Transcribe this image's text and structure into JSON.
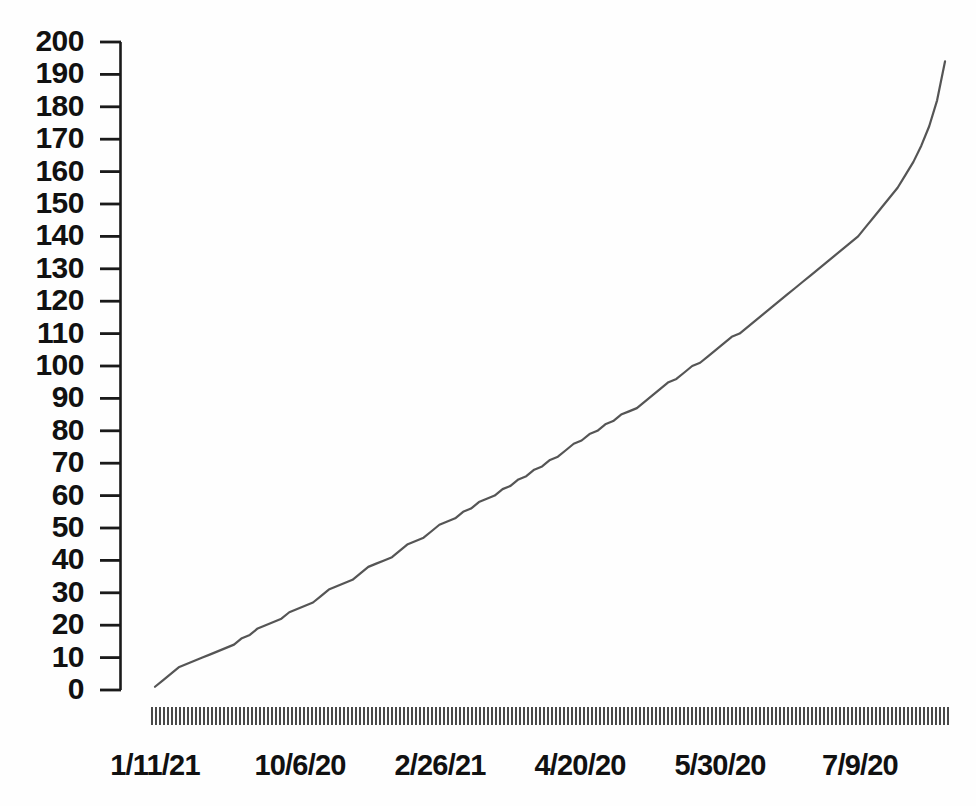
{
  "chart_data": {
    "type": "line",
    "title": "",
    "subtitle": "",
    "xlabel": "",
    "ylabel": "",
    "ylim": [
      0,
      200
    ],
    "grid": false,
    "legend": null,
    "y_ticks": [
      200,
      190,
      180,
      170,
      160,
      150,
      140,
      130,
      120,
      110,
      100,
      90,
      80,
      70,
      60,
      50,
      40,
      30,
      20,
      10,
      0
    ],
    "x_tick_labels": [
      "1/11/21",
      "10/6/20",
      "2/26/21",
      "4/20/20",
      "5/30/20",
      "7/9/20"
    ],
    "x_tick_label_positions_px": [
      155,
      300,
      440,
      580,
      720,
      860
    ],
    "x_minor_tick_count": 200,
    "series": [
      {
        "name": "cumulative",
        "color": "#555555",
        "x": [
          0,
          1,
          2,
          3,
          4,
          5,
          6,
          7,
          8,
          9,
          10,
          11,
          12,
          13,
          14,
          15,
          16,
          17,
          18,
          19,
          20,
          21,
          22,
          23,
          24,
          25,
          26,
          27,
          28,
          29,
          30,
          31,
          32,
          33,
          34,
          35,
          36,
          37,
          38,
          39,
          40,
          41,
          42,
          43,
          44,
          45,
          46,
          47,
          48,
          49,
          50,
          51,
          52,
          53,
          54,
          55,
          56,
          57,
          58,
          59,
          60,
          61,
          62,
          63,
          64,
          65,
          66,
          67,
          68,
          69,
          70,
          71,
          72,
          73,
          74,
          75,
          76,
          77,
          78,
          79,
          80,
          81,
          82,
          83,
          84,
          85,
          86,
          87,
          88,
          89,
          90,
          91,
          92,
          93,
          94,
          95,
          96,
          97,
          98,
          99,
          100
        ],
        "values": [
          1,
          3,
          5,
          7,
          8,
          9,
          10,
          11,
          12,
          13,
          14,
          16,
          17,
          19,
          20,
          21,
          22,
          24,
          25,
          26,
          27,
          29,
          31,
          32,
          33,
          34,
          36,
          38,
          39,
          40,
          41,
          43,
          45,
          46,
          47,
          49,
          51,
          52,
          53,
          55,
          56,
          58,
          59,
          60,
          62,
          63,
          65,
          66,
          68,
          69,
          71,
          72,
          74,
          76,
          77,
          79,
          80,
          82,
          83,
          85,
          86,
          87,
          89,
          91,
          93,
          95,
          96,
          98,
          100,
          101,
          103,
          105,
          107,
          109,
          110,
          112,
          114,
          116,
          118,
          120,
          122,
          124,
          126,
          128,
          130,
          132,
          134,
          136,
          138,
          140,
          143,
          146,
          149,
          152,
          155,
          159,
          163,
          168,
          174,
          182,
          194
        ]
      }
    ]
  },
  "axes": {
    "y_axis_top_value": 200,
    "y_axis_bottom_value": 0,
    "y_axis_step": 10
  }
}
